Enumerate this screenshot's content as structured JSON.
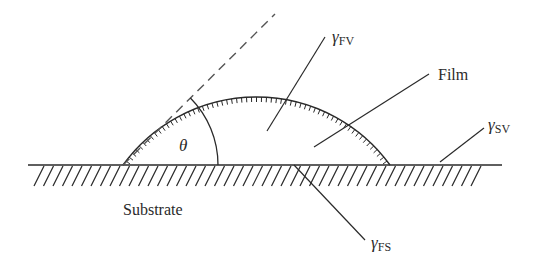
{
  "diagram": {
    "type": "contact-angle / wetting schematic",
    "colors": {
      "stroke": "#2a2a2a",
      "dashed": "#555555",
      "background": "#ffffff"
    },
    "labels": {
      "gamma_fv": {
        "symbol": "γ",
        "subscript": "FV"
      },
      "gamma_sv": {
        "symbol": "γ",
        "subscript": "SV"
      },
      "gamma_fs": {
        "symbol": "γ",
        "subscript": "FS"
      },
      "film": "Film",
      "substrate": "Substrate",
      "theta": "θ"
    },
    "elements": [
      "substrate surface line with hatching",
      "film droplet cap with inner hatching",
      "dashed tangent line at contact point",
      "contact angle arc θ",
      "leader lines to surface tension labels"
    ]
  }
}
